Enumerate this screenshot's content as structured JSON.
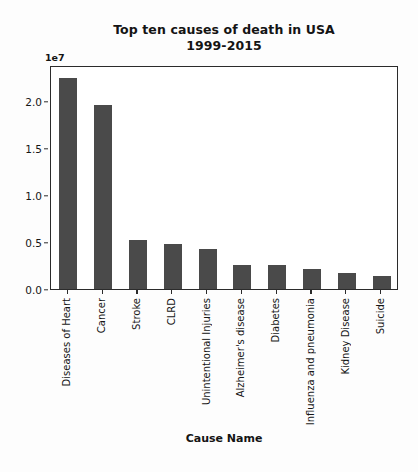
{
  "chart_data": {
    "type": "bar",
    "title": "Top ten causes of death in USA 1999-2015",
    "title_line1": "Top ten causes of death in USA",
    "title_line2": "1999-2015",
    "xlabel": "Cause Name",
    "ylabel": "",
    "y_exponent_label": "1e7",
    "y_exponent_value": 10000000,
    "grid": false,
    "legend": null,
    "ylim": [
      0,
      2.38
    ],
    "ytick_labels": [
      "0.0",
      "0.5",
      "1.0",
      "1.5",
      "2.0"
    ],
    "ytick_values": [
      0.0,
      0.5,
      1.0,
      1.5,
      2.0
    ],
    "categories": [
      "Diseases of Heart",
      "Cancer",
      "Stroke",
      "CLRD",
      "Unintentional Injuries",
      "Alzheimer's disease",
      "Diabetes",
      "Influenza and pneumonia",
      "Kidney Disease",
      "Suicide"
    ],
    "values": [
      2.24,
      1.96,
      0.52,
      0.48,
      0.43,
      0.26,
      0.26,
      0.21,
      0.17,
      0.14
    ],
    "values_absolute": [
      22400000,
      19600000,
      5200000,
      4800000,
      4300000,
      2600000,
      2600000,
      2100000,
      1700000,
      1400000
    ],
    "bar_color": "#4a4a4a",
    "axis_color": "#2b2b2b",
    "background_color": "#ffffff"
  },
  "figure": {
    "axis_title_x": "Cause Name"
  }
}
